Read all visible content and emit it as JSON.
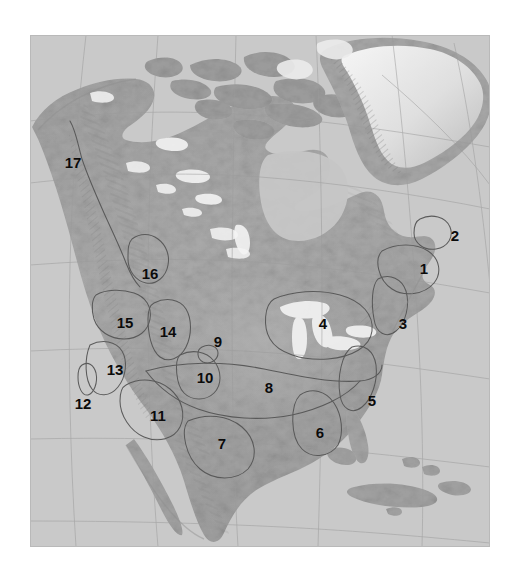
{
  "figure": {
    "kind": "shaded-relief-map",
    "region": "North America",
    "background_color": "#ffffff",
    "ocean_color": "#c9c9c9",
    "land_color": "#aaaaaa",
    "ice_color": "#f2f2f2",
    "outline_color": "#5c5c5c",
    "graticule_color": "#9a9a9a",
    "label_color": "#0b0b0b"
  },
  "map": {
    "plate": {
      "x": 30,
      "y": 35,
      "width": 460,
      "height": 512
    },
    "labels": [
      {
        "id": "1",
        "text": "1",
        "x": 394,
        "y": 233
      },
      {
        "id": "2",
        "text": "2",
        "x": 425,
        "y": 200
      },
      {
        "id": "3",
        "text": "3",
        "x": 373,
        "y": 288
      },
      {
        "id": "4",
        "text": "4",
        "x": 293,
        "y": 288
      },
      {
        "id": "5",
        "text": "5",
        "x": 342,
        "y": 365
      },
      {
        "id": "6",
        "text": "6",
        "x": 290,
        "y": 397
      },
      {
        "id": "7",
        "text": "7",
        "x": 192,
        "y": 408
      },
      {
        "id": "8",
        "text": "8",
        "x": 239,
        "y": 352
      },
      {
        "id": "9",
        "text": "9",
        "x": 188,
        "y": 306
      },
      {
        "id": "10",
        "text": "10",
        "x": 175,
        "y": 342
      },
      {
        "id": "11",
        "text": "11",
        "x": 128,
        "y": 380
      },
      {
        "id": "12",
        "text": "12",
        "x": 53,
        "y": 368
      },
      {
        "id": "13",
        "text": "13",
        "x": 85,
        "y": 334
      },
      {
        "id": "14",
        "text": "14",
        "x": 138,
        "y": 296
      },
      {
        "id": "15",
        "text": "15",
        "x": 95,
        "y": 287
      },
      {
        "id": "16",
        "text": "16",
        "x": 120,
        "y": 238
      },
      {
        "id": "17",
        "text": "17",
        "x": 43,
        "y": 127
      }
    ]
  }
}
